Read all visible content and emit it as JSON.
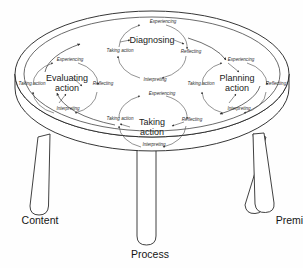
{
  "figure": {
    "type": "diagram"
  },
  "legs": [
    {
      "id": "content",
      "label": "Content",
      "position": "left"
    },
    {
      "id": "process",
      "label": "Process",
      "position": "center"
    },
    {
      "id": "premise",
      "label": "Premise",
      "position": "right"
    }
  ],
  "cycles": [
    {
      "id": "diagnosing",
      "label": "Diagnosing",
      "position": "top",
      "stages": [
        {
          "id": "experiencing",
          "label": "Experiencing"
        },
        {
          "id": "reflecting",
          "label": "Reflecting"
        },
        {
          "id": "interpreting",
          "label": "Interpreting"
        },
        {
          "id": "taking-action",
          "label": "Taking action"
        }
      ]
    },
    {
      "id": "evaluating-action",
      "label": "Evaluating action",
      "label_line1": "Evaluating",
      "label_line2": "action",
      "position": "left",
      "stages": [
        {
          "id": "experiencing",
          "label": "Experiencing"
        },
        {
          "id": "reflecting",
          "label": "Reflecting"
        },
        {
          "id": "interpreting",
          "label": "Interpreting"
        },
        {
          "id": "taking-action",
          "label": "Taking action"
        }
      ]
    },
    {
      "id": "planning-action",
      "label": "Planning action",
      "label_line1": "Planning",
      "label_line2": "action",
      "position": "right",
      "stages": [
        {
          "id": "experiencing",
          "label": "Experiencing"
        },
        {
          "id": "reflecting",
          "label": "Reflecting"
        },
        {
          "id": "interpreting",
          "label": "Interpreting"
        },
        {
          "id": "taking-action",
          "label": "Taking action"
        }
      ]
    },
    {
      "id": "taking-action",
      "label": "Taking action",
      "label_line1": "Taking",
      "label_line2": "action",
      "position": "bottom",
      "stages": [
        {
          "id": "experiencing",
          "label": "Experiencing"
        },
        {
          "id": "reflecting",
          "label": "Reflecting"
        },
        {
          "id": "interpreting",
          "label": "Interpreting"
        },
        {
          "id": "taking-action",
          "label": "Taking action"
        }
      ]
    }
  ],
  "colors": {
    "background": "#fefefe",
    "line": "#2b2b2b",
    "cycle_line": "#4a4a4a",
    "text": "#1b1b1b"
  }
}
